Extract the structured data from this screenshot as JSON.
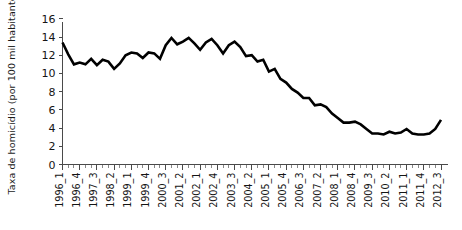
{
  "chart_data": {
    "type": "line",
    "title": "",
    "xlabel": "",
    "ylabel": "Taxa de homicídio (por 100 mil habitantes)",
    "ylim": [
      0,
      16
    ],
    "yticks": [
      0,
      2,
      4,
      6,
      8,
      10,
      12,
      14,
      16
    ],
    "grid": false,
    "legend": "none",
    "x": [
      "1996_1",
      "1996_2",
      "1996_3",
      "1996_4",
      "1997_1",
      "1997_2",
      "1997_3",
      "1997_4",
      "1998_1",
      "1998_2",
      "1998_3",
      "1998_4",
      "1999_1",
      "1999_2",
      "1999_3",
      "1999_4",
      "2000_1",
      "2000_2",
      "2000_3",
      "2000_4",
      "2001_1",
      "2001_2",
      "2001_3",
      "2001_4",
      "2002_1",
      "2002_2",
      "2002_3",
      "2002_4",
      "2003_1",
      "2003_2",
      "2003_3",
      "2003_4",
      "2004_1",
      "2004_2",
      "2004_3",
      "2004_4",
      "2005_1",
      "2005_2",
      "2005_3",
      "2005_4",
      "2006_1",
      "2006_2",
      "2006_3",
      "2006_4",
      "2007_1",
      "2007_2",
      "2007_3",
      "2007_4",
      "2008_1",
      "2008_2",
      "2008_3",
      "2008_4",
      "2009_1",
      "2009_2",
      "2009_3",
      "2009_4",
      "2010_1",
      "2010_2",
      "2010_3",
      "2010_4",
      "2011_1",
      "2011_2",
      "2011_3",
      "2011_4",
      "2012_1",
      "2012_2",
      "2012_3"
    ],
    "xtick_labels": [
      "1996_1",
      "1996_4",
      "1997_3",
      "1998_2",
      "1999_1",
      "1999_4",
      "2000_3",
      "2001_2",
      "2002_1",
      "2002_4",
      "2003_3",
      "2004_2",
      "2005_1",
      "2005_4",
      "2006_3",
      "2007_2",
      "2008_1",
      "2008_4",
      "2009_3",
      "2010_2",
      "2011_1",
      "2011_4",
      "2012_3"
    ],
    "xtick_label_every": 3,
    "values": [
      13.4,
      12.1,
      11.0,
      11.2,
      11.0,
      11.6,
      10.9,
      11.5,
      11.3,
      10.5,
      11.1,
      12.0,
      12.3,
      12.2,
      11.7,
      12.3,
      12.2,
      11.6,
      13.1,
      13.9,
      13.2,
      13.5,
      13.9,
      13.3,
      12.6,
      13.4,
      13.8,
      13.1,
      12.2,
      13.1,
      13.5,
      12.9,
      11.9,
      12.0,
      11.3,
      11.5,
      10.2,
      10.5,
      9.4,
      9.0,
      8.3,
      7.9,
      7.3,
      7.3,
      6.5,
      6.6,
      6.3,
      5.6,
      5.1,
      4.6,
      4.6,
      4.7,
      4.4,
      3.9,
      3.4,
      3.4,
      3.3,
      3.6,
      3.4,
      3.5,
      3.9,
      3.4,
      3.3,
      3.3,
      3.4,
      3.9,
      4.9
    ],
    "line_color": "#000000",
    "axis_color": "#4a4a4a"
  }
}
